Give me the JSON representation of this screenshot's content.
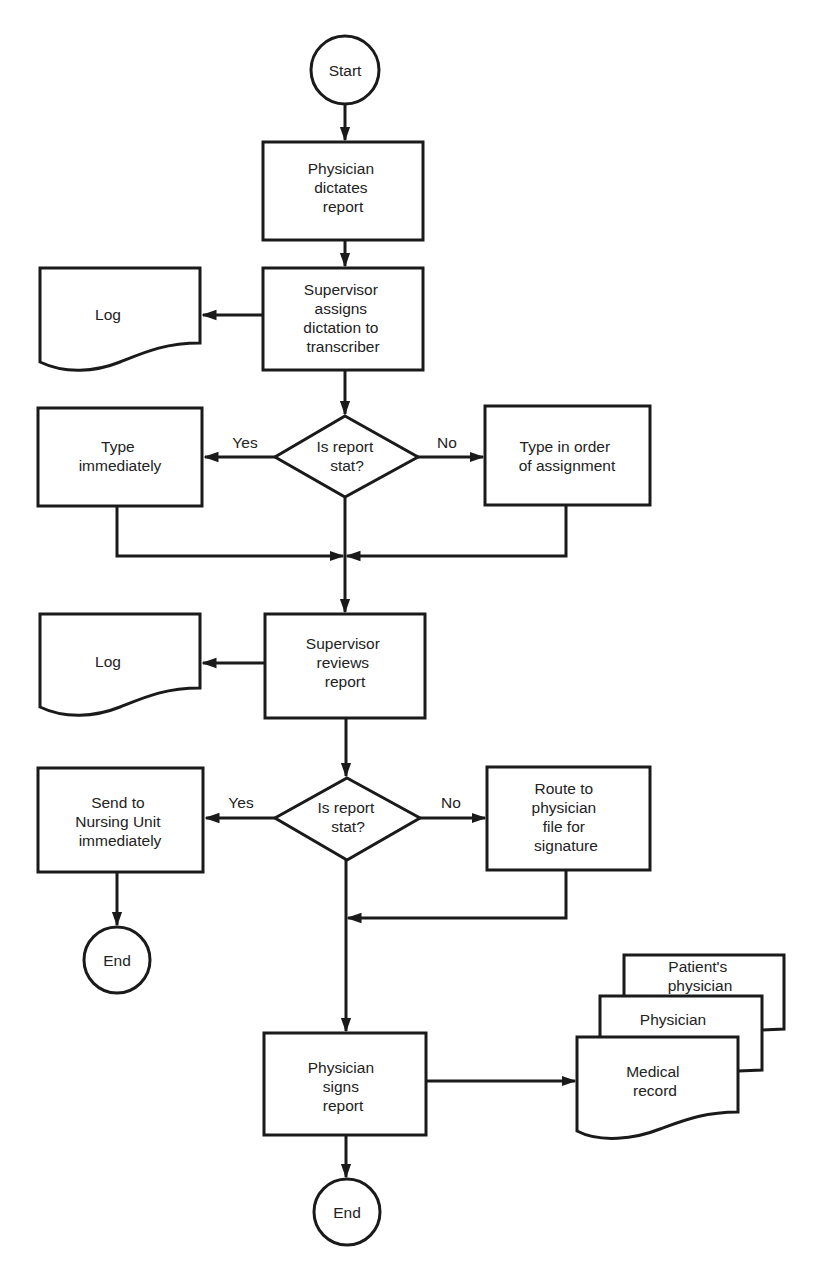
{
  "diagram": {
    "type": "flowchart",
    "colors": {
      "stroke": "#1a1a1a",
      "text": "#222222",
      "background": "#ffffff"
    },
    "nodes": {
      "start": {
        "shape": "terminator",
        "lines": [
          "Start"
        ]
      },
      "dictate": {
        "shape": "process",
        "lines": [
          "Physician",
          "dictates",
          "report"
        ]
      },
      "assign": {
        "shape": "process",
        "lines": [
          "Supervisor",
          "assigns",
          "dictation to",
          "transcriber"
        ]
      },
      "log1": {
        "shape": "document",
        "lines": [
          "Log"
        ]
      },
      "decision1": {
        "shape": "decision",
        "lines": [
          "Is report",
          "stat?"
        ]
      },
      "type_now": {
        "shape": "process",
        "lines": [
          "Type",
          "immediately"
        ]
      },
      "type_order": {
        "shape": "process",
        "lines": [
          "Type in order",
          "of assignment"
        ]
      },
      "review": {
        "shape": "process",
        "lines": [
          "Supervisor",
          "reviews",
          "report"
        ]
      },
      "log2": {
        "shape": "document",
        "lines": [
          "Log"
        ]
      },
      "decision2": {
        "shape": "decision",
        "lines": [
          "Is report",
          "stat?"
        ]
      },
      "send_nursing": {
        "shape": "process",
        "lines": [
          "Send to",
          "Nursing Unit",
          "immediately"
        ]
      },
      "route": {
        "shape": "process",
        "lines": [
          "Route to",
          "physician",
          "file for",
          "signature"
        ]
      },
      "end1": {
        "shape": "terminator",
        "lines": [
          "End"
        ]
      },
      "signs": {
        "shape": "process",
        "lines": [
          "Physician",
          "signs",
          "report"
        ]
      },
      "doc_patient": {
        "shape": "document",
        "lines": [
          "Patient's",
          "physician"
        ]
      },
      "doc_physician": {
        "shape": "document",
        "lines": [
          "Physician"
        ]
      },
      "doc_medical": {
        "shape": "document",
        "lines": [
          "Medical",
          "record"
        ]
      },
      "end2": {
        "shape": "terminator",
        "lines": [
          "End"
        ]
      }
    },
    "edge_labels": {
      "d1_yes": "Yes",
      "d1_no": "No",
      "d2_yes": "Yes",
      "d2_no": "No"
    },
    "edges": [
      {
        "from": "start",
        "to": "dictate"
      },
      {
        "from": "dictate",
        "to": "assign"
      },
      {
        "from": "assign",
        "to": "log1"
      },
      {
        "from": "assign",
        "to": "decision1"
      },
      {
        "from": "decision1",
        "to": "type_now",
        "label": "Yes"
      },
      {
        "from": "decision1",
        "to": "type_order",
        "label": "No"
      },
      {
        "from": "type_now",
        "to": "review"
      },
      {
        "from": "type_order",
        "to": "review"
      },
      {
        "from": "review",
        "to": "log2"
      },
      {
        "from": "review",
        "to": "decision2"
      },
      {
        "from": "decision2",
        "to": "send_nursing",
        "label": "Yes"
      },
      {
        "from": "decision2",
        "to": "route",
        "label": "No"
      },
      {
        "from": "send_nursing",
        "to": "end1"
      },
      {
        "from": "route",
        "to": "signs"
      },
      {
        "from": "signs",
        "to": "doc_medical"
      },
      {
        "from": "signs",
        "to": "end2"
      }
    ]
  }
}
